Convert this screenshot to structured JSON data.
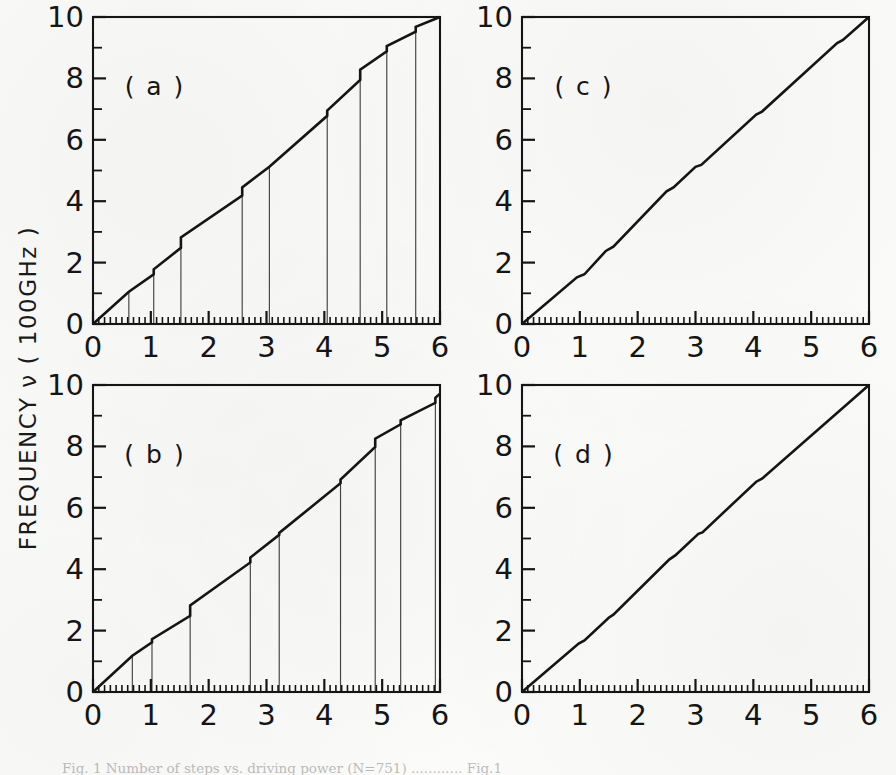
{
  "figure": {
    "axis_label_y": "FREQUENCY ν ( 100GHz )",
    "caption": "Fig. 1  Number of steps vs. driving power (N=751) ............ Fig.1",
    "ink_color": "#151515",
    "paper_color": "#fbfbfa"
  },
  "chart_data": [
    {
      "type": "line",
      "panel": "a",
      "title": "( a )",
      "xlabel": "",
      "ylabel": "FREQUENCY ν ( 100GHz )",
      "xlim": [
        0,
        6
      ],
      "ylim": [
        0,
        10
      ],
      "xticks": [
        0,
        1,
        2,
        3,
        4,
        5,
        6
      ],
      "yticks": [
        0,
        2,
        4,
        6,
        8,
        10
      ],
      "xticklabels": [
        "0",
        "1",
        "2",
        "3",
        "4",
        "5",
        "6"
      ],
      "yticklabels": [
        "0",
        "2",
        "4",
        "6",
        "8",
        "10"
      ],
      "minor_tick_step": 0.1,
      "y_minor_tick_step": 1,
      "grid": false,
      "has_drop_lines": true,
      "drop_lines_x": [
        0.62,
        1.05,
        1.52,
        2.58,
        3.05,
        4.05,
        4.62,
        5.08,
        5.58
      ],
      "series": [
        {
          "name": "staircase",
          "comment": "step plateau endpoints: [x_start, x_end, y_start, y_end] of each sloped run, jumps occur at plateau ends",
          "x": [
            0.0,
            0.62,
            0.62,
            1.05,
            1.05,
            1.52,
            1.52,
            2.58,
            2.58,
            3.05,
            3.05,
            4.05,
            4.05,
            4.62,
            4.62,
            5.08,
            5.08,
            5.58,
            5.58,
            6.0
          ],
          "y": [
            0.0,
            1.05,
            1.05,
            1.62,
            1.78,
            2.48,
            2.82,
            4.18,
            4.45,
            5.12,
            5.12,
            6.78,
            6.95,
            7.95,
            8.28,
            8.88,
            9.05,
            9.52,
            9.68,
            10.0
          ]
        }
      ]
    },
    {
      "type": "line",
      "panel": "c",
      "title": "( c )",
      "xlabel": "",
      "ylabel": "",
      "xlim": [
        0,
        6
      ],
      "ylim": [
        0,
        10
      ],
      "xticks": [
        0,
        1,
        2,
        3,
        4,
        5,
        6
      ],
      "yticks": [
        0,
        2,
        4,
        6,
        8,
        10
      ],
      "xticklabels": [
        "0",
        "1",
        "2",
        "3",
        "4",
        "5",
        "6"
      ],
      "yticklabels": [
        "0",
        "2",
        "4",
        "6",
        "8",
        "10"
      ],
      "minor_tick_step": 0.1,
      "y_minor_tick_step": 1,
      "grid": false,
      "has_drop_lines": false,
      "drop_lines_x": [],
      "series": [
        {
          "name": "staircase",
          "comment": "near-linear with very small plateaus",
          "x": [
            0.0,
            0.95,
            1.08,
            1.45,
            1.58,
            2.5,
            2.62,
            3.0,
            3.1,
            4.05,
            4.15,
            5.45,
            5.55,
            6.0
          ],
          "y": [
            0.0,
            1.52,
            1.62,
            2.38,
            2.52,
            4.32,
            4.45,
            5.12,
            5.18,
            6.82,
            6.92,
            9.15,
            9.25,
            10.0
          ]
        }
      ]
    },
    {
      "type": "line",
      "panel": "b",
      "title": "( b )",
      "xlabel": "",
      "ylabel": "",
      "xlim": [
        0,
        6
      ],
      "ylim": [
        0,
        10
      ],
      "xticks": [
        0,
        1,
        2,
        3,
        4,
        5,
        6
      ],
      "yticks": [
        0,
        2,
        4,
        6,
        8,
        10
      ],
      "xticklabels": [
        "0",
        "1",
        "2",
        "3",
        "4",
        "5",
        "6"
      ],
      "yticklabels": [
        "0",
        "2",
        "4",
        "6",
        "8",
        "10"
      ],
      "minor_tick_step": 0.1,
      "y_minor_tick_step": 1,
      "grid": false,
      "has_drop_lines": true,
      "drop_lines_x": [
        0.68,
        1.02,
        1.68,
        2.72,
        3.22,
        4.28,
        4.88,
        5.32,
        5.92
      ],
      "series": [
        {
          "name": "staircase",
          "comment": "steps with drop lines, ends slightly below 10",
          "x": [
            0.0,
            0.68,
            0.68,
            1.02,
            1.02,
            1.68,
            1.68,
            2.72,
            2.72,
            3.22,
            3.22,
            4.28,
            4.28,
            4.88,
            4.88,
            5.32,
            5.32,
            5.92,
            5.92,
            6.0
          ],
          "y": [
            0.0,
            1.18,
            1.18,
            1.62,
            1.72,
            2.48,
            2.82,
            4.22,
            4.38,
            5.12,
            5.18,
            6.8,
            6.92,
            7.98,
            8.25,
            8.72,
            8.85,
            9.42,
            9.58,
            9.72
          ]
        }
      ]
    },
    {
      "type": "line",
      "panel": "d",
      "title": "( d )",
      "xlabel": "",
      "ylabel": "",
      "xlim": [
        0,
        6
      ],
      "ylim": [
        0,
        10
      ],
      "xticks": [
        0,
        1,
        2,
        3,
        4,
        5,
        6
      ],
      "yticks": [
        0,
        2,
        4,
        6,
        8,
        10
      ],
      "xticklabels": [
        "0",
        "1",
        "2",
        "3",
        "4",
        "5",
        "6"
      ],
      "yticklabels": [
        "0",
        "2",
        "4",
        "6",
        "8",
        "10"
      ],
      "minor_tick_step": 0.1,
      "y_minor_tick_step": 1,
      "grid": false,
      "has_drop_lines": false,
      "drop_lines_x": [],
      "series": [
        {
          "name": "staircase",
          "comment": "essentially a straight diagonal, faint kinks near x=1.0 and x=2.6",
          "x": [
            0.0,
            0.98,
            1.08,
            1.5,
            1.58,
            2.55,
            2.65,
            3.05,
            3.12,
            4.05,
            4.15,
            6.0
          ],
          "y": [
            0.0,
            1.58,
            1.68,
            2.42,
            2.52,
            4.32,
            4.45,
            5.15,
            5.2,
            6.85,
            6.95,
            10.0
          ]
        }
      ]
    }
  ]
}
